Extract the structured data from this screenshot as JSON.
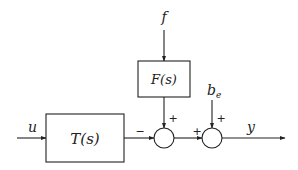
{
  "diagram": {
    "type": "block-diagram",
    "blocks": [
      {
        "id": "T",
        "label": "T(s)"
      },
      {
        "id": "F",
        "label": "F(s)"
      }
    ],
    "signals": {
      "input_u": "u",
      "input_f": "f",
      "disturbance_be": "b",
      "disturbance_be_subscript": "e",
      "output_y": "y"
    },
    "summing_junctions": [
      {
        "id": "sum1",
        "inputs": [
          {
            "from": "T(s)",
            "sign": "−"
          },
          {
            "from": "F(s)",
            "sign": "+"
          }
        ]
      },
      {
        "id": "sum2",
        "inputs": [
          {
            "from": "sum1",
            "sign": "+"
          },
          {
            "from": "b_e",
            "sign": "+"
          }
        ]
      }
    ],
    "edges": [
      {
        "from": "u",
        "to": "T(s)"
      },
      {
        "from": "T(s)",
        "to": "sum1"
      },
      {
        "from": "f",
        "to": "F(s)"
      },
      {
        "from": "F(s)",
        "to": "sum1"
      },
      {
        "from": "sum1",
        "to": "sum2"
      },
      {
        "from": "b_e",
        "to": "sum2"
      },
      {
        "from": "sum2",
        "to": "y"
      }
    ]
  }
}
